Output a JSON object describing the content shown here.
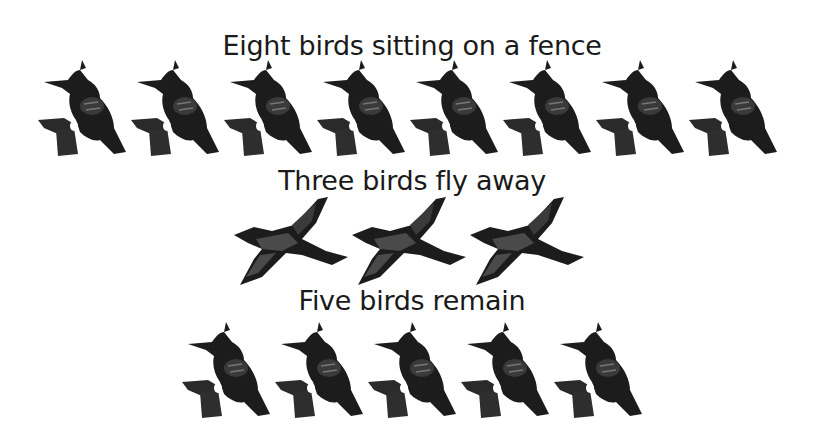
{
  "captions": {
    "line1": "Eight birds sitting on a fence",
    "line2": "Three birds fly away",
    "line3": "Five birds remain"
  },
  "rows": {
    "sitting": {
      "count": 8,
      "icon": "perched-bird-icon"
    },
    "flying": {
      "count": 3,
      "icon": "flying-bird-icon"
    },
    "remaining": {
      "count": 5,
      "icon": "perched-bird-icon"
    }
  },
  "colors": {
    "bird_dark": "#1c1c1c",
    "bird_mid": "#4a4a4a",
    "background": "#ffffff"
  }
}
